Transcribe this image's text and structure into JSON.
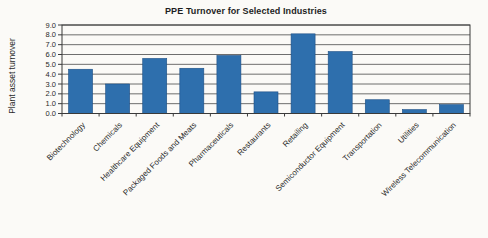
{
  "page": {
    "background_color": "#fbfaf7"
  },
  "chart_data": {
    "type": "bar",
    "title": "PPE Turnover for Selected Industries",
    "xlabel": "",
    "ylabel": "Plant asset turnover",
    "categories": [
      "Biotechnology",
      "Chemicals",
      "Healthcare Equipment",
      "Packaged Foods and Meats",
      "Pharmaceuticals",
      "Restaurants",
      "Retailing",
      "Semiconductor Equipment",
      "Transportation",
      "Utilities",
      "Wireless Telecommunication"
    ],
    "values": [
      4.5,
      3.0,
      5.6,
      4.6,
      5.9,
      2.2,
      8.1,
      6.3,
      1.4,
      0.4,
      0.9
    ],
    "ylim": [
      0,
      9
    ],
    "ytick_step": 1.0,
    "ytick_labels": [
      "0.0",
      "1.0",
      "2.0",
      "3.0",
      "4.0",
      "5.0",
      "6.0",
      "7.0",
      "8.0",
      "9.0"
    ],
    "grid": "horizontal",
    "legend_position": "none",
    "bar_color": "#2e6fad",
    "bar_border_color": "#1d4f85",
    "gridline_color": "#4a4a4a",
    "axis_color": "#3a3a3a"
  }
}
